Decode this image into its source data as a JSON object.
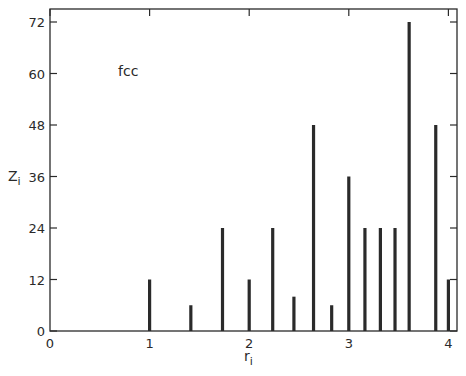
{
  "chart_data": {
    "type": "bar",
    "title": "",
    "annotation": "fcc",
    "xlabel": "r",
    "xlabel_sub": "i",
    "ylabel": "Z",
    "ylabel_sub": "i",
    "xlim": [
      0,
      4.07
    ],
    "ylim": [
      0,
      74
    ],
    "xticks": [
      0,
      1,
      2,
      3,
      4
    ],
    "yticks": [
      0,
      12,
      24,
      36,
      48,
      60,
      72
    ],
    "grid": false,
    "legend": null,
    "x": [
      1.0,
      1.414,
      1.732,
      2.0,
      2.236,
      2.449,
      2.646,
      2.828,
      3.0,
      3.162,
      3.317,
      3.464,
      3.606,
      3.873,
      4.0
    ],
    "values": [
      12,
      6,
      24,
      12,
      24,
      8,
      48,
      6,
      36,
      24,
      24,
      24,
      72,
      48,
      12
    ]
  }
}
